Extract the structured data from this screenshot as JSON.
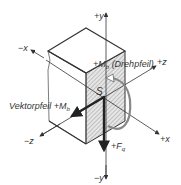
{
  "diagram": {
    "axes": {
      "plus_y": "+y",
      "minus_y": "−y",
      "plus_z": "+z",
      "minus_z": "−z",
      "plus_x": "+x",
      "minus_x": "−x"
    },
    "labels": {
      "moment_rotation_prefix": "+M",
      "moment_rotation_sub": "b",
      "moment_rotation_note": "(Drehpfeil)",
      "vector_arrow_text": "Vektorpfeil +M",
      "vector_arrow_sub": "b",
      "centroid": "S",
      "force_prefix": "+F",
      "force_sub": "q"
    },
    "colors": {
      "line": "#333333",
      "shading": "#c8c8c8",
      "background": "#ffffff"
    }
  }
}
